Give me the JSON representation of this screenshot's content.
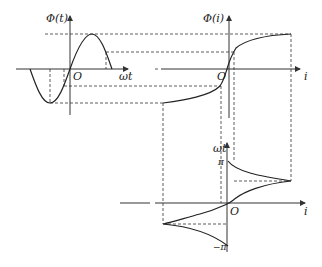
{
  "figure": {
    "panels": [
      {
        "id": "flux-time",
        "y_label": "Φ(t)",
        "x_label": "ωt",
        "origin_label": "O"
      },
      {
        "id": "flux-current",
        "y_label": "Φ(i)",
        "x_label": "i",
        "origin_label": "O"
      },
      {
        "id": "time-current",
        "y_label": "ωt",
        "x_label": "i",
        "origin_label": "O",
        "y_tick_top": "π",
        "y_tick_bottom": "−π"
      }
    ]
  },
  "colors": {
    "line": "#222222",
    "axis": "#333333",
    "background": "#ffffff"
  }
}
